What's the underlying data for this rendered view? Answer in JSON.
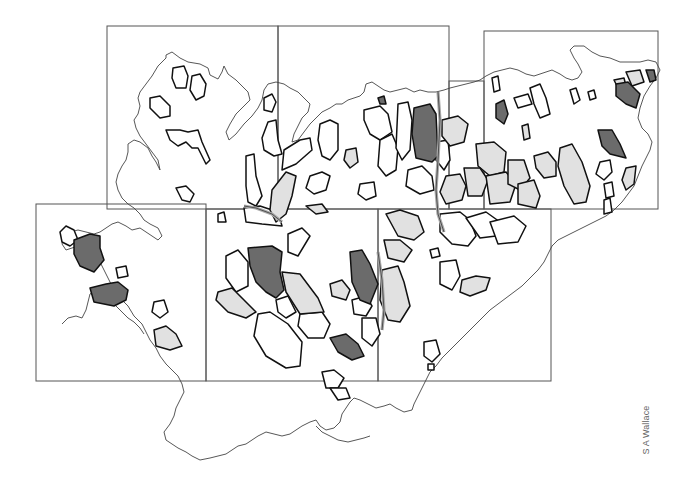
{
  "map": {
    "credit": "S A Wallace",
    "colors": {
      "background": "#ffffff",
      "frame_stroke": "#555555",
      "coast_stroke": "#444444",
      "patch_stroke": "#111111",
      "fill_dark": "#6b6b6b",
      "fill_light": "#e1e1e1",
      "fill_none": "#ffffff"
    },
    "legend_categories": [
      {
        "key": "dark",
        "fill": "#6b6b6b"
      },
      {
        "key": "light",
        "fill": "#e1e1e1"
      },
      {
        "key": "none",
        "fill": "#ffffff"
      }
    ],
    "sheet_frames": [
      {
        "id": "top-left",
        "x": 107,
        "y": 26,
        "w": 171,
        "h": 183
      },
      {
        "id": "top-middle",
        "x": 278,
        "y": 26,
        "w": 171,
        "h": 183
      },
      {
        "id": "top-connector",
        "x": 449,
        "y": 81,
        "w": 35,
        "h": 128
      },
      {
        "id": "top-right",
        "x": 484,
        "y": 31,
        "w": 174,
        "h": 178
      },
      {
        "id": "bottom-left",
        "x": 36,
        "y": 204,
        "w": 170,
        "h": 177
      },
      {
        "id": "bottom-middle",
        "x": 206,
        "y": 209,
        "w": 172,
        "h": 172
      },
      {
        "id": "bottom-right",
        "x": 378,
        "y": 209,
        "w": 173,
        "h": 172
      }
    ]
  }
}
